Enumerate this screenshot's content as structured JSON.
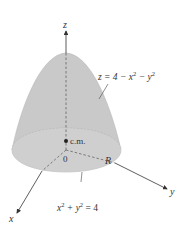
{
  "figure": {
    "type": "3d-solid-diagram"
  },
  "labels": {
    "z_axis": "z",
    "y_axis": "y",
    "x_axis": "x",
    "origin": "0",
    "surface_eq_lhs": "z = 4 − x",
    "surface_eq_exp1": "2",
    "surface_eq_mid": " − y",
    "surface_eq_exp2": "2",
    "center_of_mass": "c.m.",
    "region": "R",
    "base_eq_x": "x",
    "base_eq_exp1": "2",
    "base_eq_mid": " + y",
    "base_eq_exp2": "2",
    "base_eq_rhs": " = 4"
  },
  "colors": {
    "solid_fill": "#c8c8c8",
    "solid_edge": "#b5b5b5",
    "base_fill": "#d2d2d2",
    "axis": "#333333",
    "hidden_axis": "#555555",
    "background": "#ffffff"
  }
}
